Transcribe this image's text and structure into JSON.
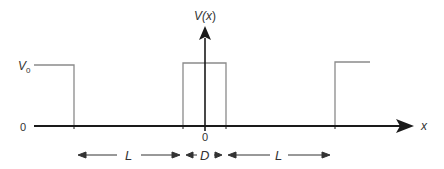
{
  "diagram": {
    "y_axis_label": "V(x)",
    "y_axis_label_parts": {
      "main": "V(",
      "var": "x",
      "close": ")"
    },
    "x_axis_label": "x",
    "levels": {
      "high_label_main": "V",
      "high_label_sub": "0",
      "zero_label": "0"
    },
    "origin_label": "0",
    "dimensions": [
      {
        "label": "L",
        "from_x": 78,
        "to_x": 180
      },
      {
        "label": "D",
        "from_x": 186,
        "to_x": 222
      },
      {
        "label": "L",
        "from_x": 228,
        "to_x": 330
      }
    ],
    "colors": {
      "axis": "#1a1a1a",
      "potential_line": "#8a8a8a",
      "text": "#333333"
    }
  }
}
